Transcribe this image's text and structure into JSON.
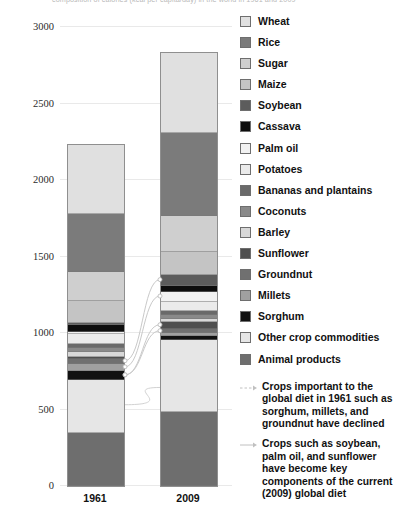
{
  "chart_title": "composition of calories (kcal per capita/day) in the world in 1961 and 2009",
  "axis": {
    "y_ticks": [
      "3000",
      "2500",
      "2000",
      "1500",
      "1000",
      "500",
      "0"
    ],
    "y_min": 0,
    "y_max": 3000,
    "x_labels": [
      "1961",
      "2009"
    ]
  },
  "legend": {
    "items": [
      {
        "label": "Wheat",
        "color": "#e0e0e0"
      },
      {
        "label": "Rice",
        "color": "#7b7b7b"
      },
      {
        "label": "Sugar",
        "color": "#cfcfcf"
      },
      {
        "label": "Maize",
        "color": "#c4c4c4"
      },
      {
        "label": "Soybean",
        "color": "#5c5c5c"
      },
      {
        "label": "Cassava",
        "color": "#0d0d0d"
      },
      {
        "label": "Palm oil",
        "color": "#f2f2f2"
      },
      {
        "label": "Potatoes",
        "color": "#ebebeb"
      },
      {
        "label": "Bananas and plantains",
        "color": "#6a6a6a"
      },
      {
        "label": "Coconuts",
        "color": "#8a8a8a"
      },
      {
        "label": "Barley",
        "color": "#d8d8d8"
      },
      {
        "label": "Sunflower",
        "color": "#4f4f4f"
      },
      {
        "label": "Groundnut",
        "color": "#707070"
      },
      {
        "label": "Millets",
        "color": "#a0a0a0"
      },
      {
        "label": "Sorghum",
        "color": "#111111"
      },
      {
        "label": "Other crop commodities",
        "color": "#e6e6e6"
      },
      {
        "label": "Animal products",
        "color": "#6e6e6e"
      }
    ]
  },
  "annotations": [
    {
      "icon": "dashed-arrow-icon",
      "text": "Crops important to the global diet in 1961 such as sorghum, millets, and groundnut have declined"
    },
    {
      "icon": "solid-arrow-icon",
      "text": "Crops such as soybean, palm oil, and sunflower have become key components of the current (2009) global diet"
    }
  ],
  "chart_data": {
    "type": "bar",
    "subtype": "stacked",
    "title": "composition of calories (kcal per capita/day) in the world in 1961 and 2009",
    "xlabel": "",
    "ylabel": "",
    "ylim": [
      0,
      3000
    ],
    "ytick_step": 500,
    "grid": true,
    "legend_position": "right",
    "categories": [
      "1961",
      "2009"
    ],
    "stack_order_top_to_bottom": [
      "Wheat",
      "Rice",
      "Sugar",
      "Maize",
      "Soybean",
      "Cassava",
      "Palm oil",
      "Potatoes",
      "Bananas and plantains",
      "Coconuts",
      "Barley",
      "Sunflower",
      "Groundnut",
      "Millets",
      "Sorghum",
      "Other crop commodities",
      "Animal products"
    ],
    "series": [
      {
        "name": "Wheat",
        "color": "#e0e0e0",
        "values": [
          455,
          525
        ]
      },
      {
        "name": "Rice",
        "color": "#7b7b7b",
        "values": [
          375,
          540
        ]
      },
      {
        "name": "Sugar",
        "color": "#cfcfcf",
        "values": [
          190,
          235
        ]
      },
      {
        "name": "Maize",
        "color": "#c4c4c4",
        "values": [
          145,
          150
        ]
      },
      {
        "name": "Soybean",
        "color": "#5c5c5c",
        "values": [
          15,
          75
        ]
      },
      {
        "name": "Cassava",
        "color": "#0d0d0d",
        "values": [
          45,
          40
        ]
      },
      {
        "name": "Palm oil",
        "color": "#f2f2f2",
        "values": [
          10,
          60
        ]
      },
      {
        "name": "Potatoes",
        "color": "#ebebeb",
        "values": [
          65,
          60
        ]
      },
      {
        "name": "Bananas and plantains",
        "color": "#6a6a6a",
        "values": [
          30,
          30
        ]
      },
      {
        "name": "Coconuts",
        "color": "#8a8a8a",
        "values": [
          25,
          25
        ]
      },
      {
        "name": "Barley",
        "color": "#d8d8d8",
        "values": [
          30,
          20
        ]
      },
      {
        "name": "Sunflower",
        "color": "#4f4f4f",
        "values": [
          15,
          45
        ]
      },
      {
        "name": "Groundnut",
        "color": "#707070",
        "values": [
          35,
          25
        ]
      },
      {
        "name": "Millets",
        "color": "#a0a0a0",
        "values": [
          45,
          20
        ]
      },
      {
        "name": "Sorghum",
        "color": "#111111",
        "values": [
          60,
          25
        ]
      },
      {
        "name": "Other crop commodities",
        "color": "#e6e6e6",
        "values": [
          345,
          470
        ]
      },
      {
        "name": "Animal products",
        "color": "#6e6e6e",
        "values": [
          345,
          485
        ]
      }
    ],
    "totals": [
      2230,
      2830
    ]
  }
}
